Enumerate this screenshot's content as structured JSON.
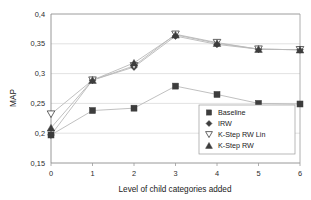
{
  "chart_data": {
    "type": "line",
    "title": "",
    "subtitle": "",
    "xlabel": "Level of child categories added",
    "ylabel": "MAP",
    "x": [
      0,
      1,
      2,
      3,
      4,
      5,
      6
    ],
    "xtick_labels": [
      "0",
      "1",
      "2",
      "3",
      "4",
      "5",
      "6"
    ],
    "ytick_labels": [
      "0,15",
      "0,2",
      "0,25",
      "0,3",
      "0,35",
      "0,4"
    ],
    "ytick_values": [
      0.15,
      0.2,
      0.25,
      0.3,
      0.35,
      0.4
    ],
    "xlim": [
      0,
      6
    ],
    "ylim": [
      0.15,
      0.4
    ],
    "grid": "horizontal",
    "legend_position": "inside-lower-right",
    "decimal_separator": ",",
    "series": [
      {
        "name": "Baseline",
        "marker": "filled-square",
        "values": [
          0.197,
          0.238,
          0.242,
          0.279,
          0.265,
          0.25,
          0.249
        ]
      },
      {
        "name": "IRW",
        "marker": "filled-diamond",
        "values": [
          0.197,
          0.289,
          0.311,
          0.363,
          0.349,
          0.341,
          0.34
        ]
      },
      {
        "name": "K-Step RW Lin",
        "marker": "open-triangle-down",
        "values": [
          0.232,
          0.289,
          0.313,
          0.366,
          0.352,
          0.341,
          0.34
        ]
      },
      {
        "name": "K-Step RW",
        "marker": "filled-triangle-up",
        "values": [
          0.209,
          0.289,
          0.318,
          0.365,
          0.351,
          0.341,
          0.34
        ]
      }
    ]
  },
  "legend": {
    "entries": [
      {
        "label": "Baseline",
        "marker": "filled-square"
      },
      {
        "label": "IRW",
        "marker": "filled-diamond"
      },
      {
        "label": "K-Step RW Lin",
        "marker": "open-triangle-down"
      },
      {
        "label": "K-Step RW",
        "marker": "filled-triangle-up"
      }
    ]
  },
  "colors": {
    "marker": "#3d3d3d",
    "line": "#b9b9b9",
    "grid": "#d6d6d6",
    "frame": "#9a9a9a",
    "text": "#1a1a1a",
    "background": "#ffffff"
  }
}
